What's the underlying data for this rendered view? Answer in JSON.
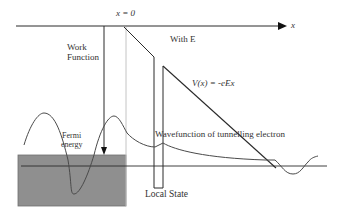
{
  "diagram": {
    "labels": {
      "x_zero": "x = 0",
      "x_axis": "x",
      "with_e": "With E",
      "work_function_line1": "Work",
      "work_function_line2": "Function",
      "potential": "V(x) = -eEx",
      "fermi_line1": "Fermi",
      "fermi_line2": "energy",
      "wavefunction": "Wavefunction of tunnelling electron",
      "local_state": "Local State"
    },
    "colors": {
      "line": "#2a2a2a",
      "light_line": "#bdbdbd",
      "metal_fill": "#8f8f8f",
      "text": "#333333",
      "background": "#ffffff"
    }
  }
}
